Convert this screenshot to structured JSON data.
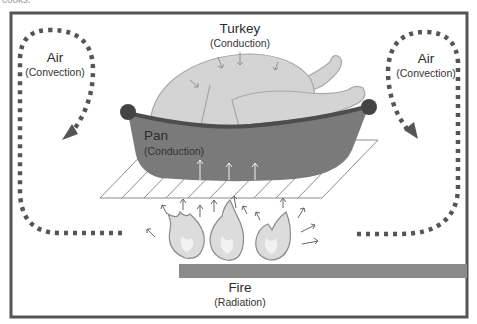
{
  "diagram": {
    "top_fragment": "cooks.",
    "labels": {
      "turkey": {
        "title": "Turkey",
        "subtitle": "(Conduction)"
      },
      "pan": {
        "title": "Pan",
        "subtitle": "(Conduction)"
      },
      "air_left": {
        "title": "Air",
        "subtitle": "(Convection)"
      },
      "air_right": {
        "title": "Air",
        "subtitle": "(Convection)"
      },
      "fire": {
        "title": "Fire",
        "subtitle": "(Radiation)"
      }
    },
    "colors": {
      "frame": "#555555",
      "turkey_fill": "#d4d4d4",
      "turkey_stroke": "#a8a8a8",
      "pan_fill": "#7a7a7a",
      "pan_rim": "#4d4d4d",
      "handle": "#444444",
      "grill_stroke": "#8c8c8c",
      "fire_bar": "#8a8a8a",
      "dots": "#555555",
      "flame_fill": "#dcdcdc",
      "flame_stroke": "#8a8a8a",
      "arrow": "#555555"
    }
  }
}
